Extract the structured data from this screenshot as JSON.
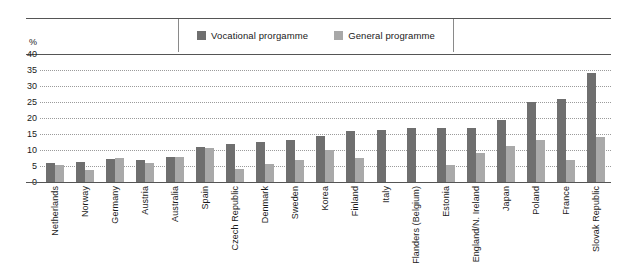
{
  "legend": {
    "items": [
      {
        "label": "Vocational prorgamme",
        "color": "#6f6f6f",
        "key": "vocational"
      },
      {
        "label": "General programme",
        "color": "#a9a9a9",
        "key": "general"
      }
    ]
  },
  "axis": {
    "unit_label": "%",
    "yticks": [
      "40",
      "35",
      "30",
      "25",
      "20",
      "15",
      "10",
      "5",
      "0"
    ]
  },
  "chart_data": {
    "type": "bar",
    "title": "",
    "xlabel": "",
    "ylabel": "%",
    "ylim": [
      0,
      40
    ],
    "ytick_step": 5,
    "grid": true,
    "legend_position": "top-center",
    "categories": [
      "Netherlands",
      "Norway",
      "Germany",
      "Austria",
      "Australia",
      "Spain",
      "Czech Republic",
      "Denmark",
      "Sweden",
      "Korea",
      "Finland",
      "Italy",
      "Flanders (Belgium)",
      "Estonia",
      "England/N. Ireland",
      "Japan",
      "Poland",
      "France",
      "Slovak Republic"
    ],
    "series": [
      {
        "name": "Vocational prorgamme",
        "color": "#6f6f6f",
        "values": [
          6.0,
          6.3,
          7.3,
          7.0,
          7.7,
          11.0,
          11.9,
          12.5,
          13.0,
          14.4,
          16.0,
          16.3,
          17.0,
          17.0,
          17.0,
          19.4,
          25.0,
          26.0,
          34.0
        ]
      },
      {
        "name": "General programme",
        "color": "#a9a9a9",
        "values": [
          5.2,
          3.8,
          7.5,
          6.0,
          7.7,
          10.7,
          4.0,
          5.6,
          6.9,
          10.0,
          7.4,
          0.0,
          0.0,
          5.3,
          9.0,
          11.3,
          13.0,
          7.0,
          14.0
        ]
      }
    ]
  }
}
